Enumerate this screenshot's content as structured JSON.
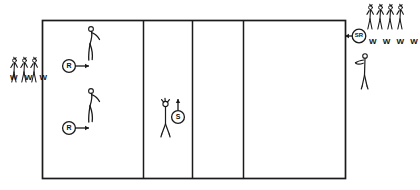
{
  "diagram": {
    "type": "court-drill-diagram",
    "title": "",
    "court": {
      "name": "court-outline",
      "x": 42,
      "y": 20,
      "width": 303,
      "height": 158,
      "stroke": "#1a1a1a",
      "stroke_width": 1.6,
      "zones": [
        {
          "name": "zone-left-receiving",
          "x": 42,
          "width": 101
        },
        {
          "name": "zone-second",
          "x": 143,
          "width": 49
        },
        {
          "name": "zone-third",
          "x": 192,
          "width": 51
        },
        {
          "name": "zone-right-serving",
          "x": 243,
          "width": 102
        }
      ],
      "divider_x": [
        143,
        192,
        243
      ]
    },
    "markers": [
      {
        "name": "marker-receiver-top",
        "label": "R",
        "cx": 69,
        "cy": 66,
        "arrow": "right"
      },
      {
        "name": "marker-receiver-bottom",
        "label": "R",
        "cx": 69,
        "cy": 128,
        "arrow": "right"
      },
      {
        "name": "marker-setter",
        "label": "S",
        "cx": 178,
        "cy": 117,
        "arrow": "up"
      },
      {
        "name": "marker-server-right",
        "label": "SR",
        "cx": 359,
        "cy": 36,
        "arrow": "left"
      }
    ],
    "figures": [
      {
        "name": "player-receiver-top",
        "x": 92,
        "y": 22,
        "pose": "arms-raised-passing"
      },
      {
        "name": "player-receiver-bottom",
        "x": 92,
        "y": 86,
        "pose": "arms-raised-passing"
      },
      {
        "name": "player-setter",
        "x": 168,
        "y": 100,
        "pose": "overhead-set"
      },
      {
        "name": "player-server",
        "x": 362,
        "y": 52,
        "pose": "serving-toss"
      }
    ],
    "waiting_groups": [
      {
        "name": "waiting-group-left",
        "side": "left",
        "count": 3,
        "label": "W W W",
        "letters": [
          "W",
          "W",
          "W"
        ],
        "x": 12,
        "y": 55
      },
      {
        "name": "waiting-group-right",
        "side": "right",
        "count": 4,
        "label": "W W W W",
        "letters": [
          "W",
          "W",
          "W",
          "W"
        ],
        "x": 367,
        "y": 2
      }
    ],
    "legend_keys": {
      "R": "Receiver",
      "S": "Setter",
      "SR": "Server",
      "W": "Waiting player"
    },
    "colors": {
      "ink": "#1a1a1a",
      "paper": "#ffffff"
    }
  }
}
